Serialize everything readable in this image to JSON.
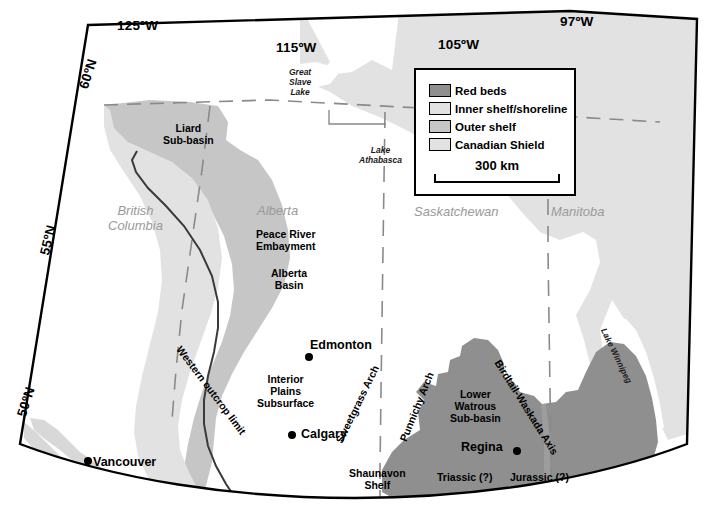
{
  "map": {
    "title": "Western Canada Sedimentary Basin - Triassic/Jurassic paleogeography",
    "background_color": "#ffffff",
    "border_color": "#000000"
  },
  "colors": {
    "red_beds": "#8f8f8f",
    "inner_shelf": "#e2e2e2",
    "outer_shelf": "#c6c6c6",
    "canadian_shield": "#e2e2e2",
    "outcrop_line": "#3a3a3a",
    "province_boundary": "#8a8a8a",
    "province_label": "#9a9a9a"
  },
  "graticule": [
    {
      "id": "lon-125",
      "label": "125ºW"
    },
    {
      "id": "lon-115",
      "label": "115ºW"
    },
    {
      "id": "lon-105",
      "label": "105ºW"
    },
    {
      "id": "lon-97",
      "label": "97ºW"
    },
    {
      "id": "lat-60",
      "label": "60ºN"
    },
    {
      "id": "lat-55",
      "label": "55ºN"
    },
    {
      "id": "lat-50",
      "label": "50ºN"
    }
  ],
  "legend": {
    "items": [
      {
        "label": "Red beds",
        "color": "#8f8f8f"
      },
      {
        "label": "Inner shelf/shoreline",
        "color": "#e2e2e2"
      },
      {
        "label": "Outer shelf",
        "color": "#c6c6c6"
      },
      {
        "label": "Canadian Shield",
        "color": "#e2e2e2"
      }
    ],
    "scale": {
      "label": "300 km"
    }
  },
  "provinces": [
    {
      "label": "British\nColumbia",
      "line1": "British",
      "line2": "Columbia"
    },
    {
      "label": "Alberta"
    },
    {
      "label": "Saskatchewan"
    },
    {
      "label": "Manitoba"
    }
  ],
  "lakes": [
    {
      "label": "Great Slave Lake",
      "line1": "Great",
      "line2": "Slave",
      "line3": "Lake"
    },
    {
      "label": "Lake Athabasca",
      "line1": "Lake",
      "line2": "Athabasca"
    },
    {
      "label": "Lake Winnipeg"
    }
  ],
  "features": [
    {
      "name": "liard-sub-basin",
      "line1": "Liard",
      "line2": "Sub-basin"
    },
    {
      "name": "peace-river-embayment",
      "line1": "Peace River",
      "line2": "Embayment"
    },
    {
      "name": "alberta-basin",
      "line1": "Alberta",
      "line2": "Basin"
    },
    {
      "name": "interior-plains-subsurface",
      "line1": "Interior",
      "line2": "Plains",
      "line3": "Subsurface"
    },
    {
      "name": "lower-watrous-sub-basin",
      "line1": "Lower",
      "line2": "Watrous",
      "line3": "Sub-basin"
    },
    {
      "name": "shaunavon-shelf",
      "line1": "Shaunavon",
      "line2": "Shelf"
    }
  ],
  "arches": [
    {
      "name": "western-outcrop-limit",
      "label": "Western outcrop limit"
    },
    {
      "name": "sweetgrass-arch",
      "label": "Sweetgrass Arch"
    },
    {
      "name": "punnichy-arch",
      "label": "Punnichy Arch"
    },
    {
      "name": "birdtail-waskada-axis",
      "label": "Birdtail-Waskada Axis"
    }
  ],
  "periods": [
    {
      "name": "triassic",
      "label": "Triassic (?)"
    },
    {
      "name": "jurassic",
      "label": "Jurassic (?)"
    }
  ],
  "cities": [
    {
      "name": "edmonton",
      "label": "Edmonton"
    },
    {
      "name": "calgary",
      "label": "Calgary"
    },
    {
      "name": "regina",
      "label": "Regina"
    },
    {
      "name": "vancouver",
      "label": "Vancouver"
    }
  ]
}
